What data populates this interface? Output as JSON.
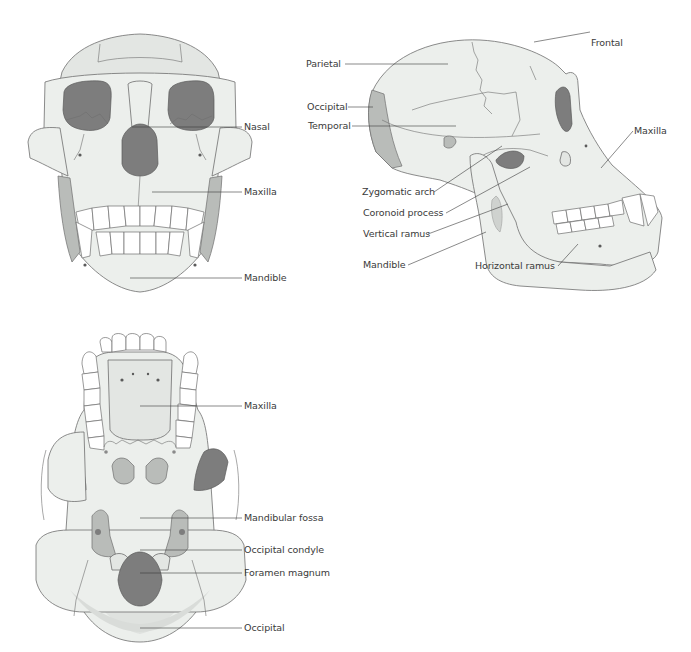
{
  "figure": {
    "panels": [
      {
        "id": "frontal-view",
        "labels": [
          {
            "text": "Nasal"
          },
          {
            "text": "Maxilla"
          },
          {
            "text": "Mandible"
          }
        ]
      },
      {
        "id": "lateral-view",
        "labels": [
          {
            "text": "Frontal"
          },
          {
            "text": "Parietal"
          },
          {
            "text": "Occipital"
          },
          {
            "text": "Temporal"
          },
          {
            "text": "Maxilla"
          },
          {
            "text": "Zygomatic arch"
          },
          {
            "text": "Coronoid process"
          },
          {
            "text": "Vertical ramus"
          },
          {
            "text": "Mandible"
          },
          {
            "text": "Horizontal ramus"
          }
        ]
      },
      {
        "id": "inferior-view",
        "labels": [
          {
            "text": "Maxilla"
          },
          {
            "text": "Mandibular fossa"
          },
          {
            "text": "Occipital condyle"
          },
          {
            "text": "Foramen magnum"
          },
          {
            "text": "Occipital"
          }
        ]
      }
    ],
    "colors": {
      "bone": "#ecefec",
      "dark_cavity": "#7d7d7d",
      "outline": "#6e6e6e",
      "label_text": "#3a3a3a"
    }
  }
}
